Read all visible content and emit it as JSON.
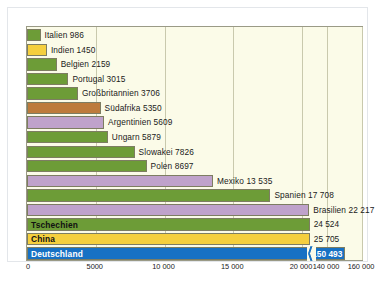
{
  "chart_data": {
    "type": "bar",
    "orientation": "horizontal",
    "title": "",
    "xlabel": "",
    "ylabel": "",
    "grid": true,
    "legend": "none",
    "axis_break": true,
    "xticks": [
      "0",
      "5000",
      "10 000",
      "15 000",
      "20 000",
      "140 000",
      "160 000"
    ],
    "xtick_values": [
      0,
      5000,
      10000,
      15000,
      20000,
      140000,
      160000
    ],
    "xlim": [
      0,
      160000
    ],
    "categories": [
      "Italien",
      "Indien",
      "Belgien",
      "Portugal",
      "Großbritannien",
      "Südafrika",
      "Argentinien",
      "Ungarn",
      "Slowakei",
      "Polen",
      "Mexiko",
      "Spanien",
      "Brasilien",
      "Tschechien",
      "China",
      "Deutschland"
    ],
    "values": [
      986,
      1450,
      2159,
      3015,
      3706,
      5350,
      5609,
      5879,
      7826,
      8697,
      13535,
      17708,
      22217,
      24524,
      25705,
      150493
    ],
    "value_labels": [
      "986",
      "1450",
      "2159",
      "3015",
      "3706",
      "5350",
      "5609",
      "5879",
      "7826",
      "8697",
      "13 535",
      "17 708",
      "22 217",
      "24 524",
      "25 705",
      "150 493"
    ],
    "rows": [
      {
        "name": "Italien",
        "value": 986,
        "value_label": "986",
        "label": "Italien 986",
        "color": "green",
        "label_position": "outside"
      },
      {
        "name": "Indien",
        "value": 1450,
        "value_label": "1450",
        "label": "Indien  1450",
        "color": "yellow",
        "label_position": "outside"
      },
      {
        "name": "Belgien",
        "value": 2159,
        "value_label": "2159",
        "label": "Belgien  2159",
        "color": "green",
        "label_position": "outside"
      },
      {
        "name": "Portugal",
        "value": 3015,
        "value_label": "3015",
        "label": "Portugal  3015",
        "color": "green",
        "label_position": "outside"
      },
      {
        "name": "Großbritannien",
        "value": 3706,
        "value_label": "3706",
        "label": "Großbritannien  3706",
        "color": "green",
        "label_position": "outside"
      },
      {
        "name": "Südafrika",
        "value": 5350,
        "value_label": "5350",
        "label": "Südafrika 5350",
        "color": "brown",
        "label_position": "outside"
      },
      {
        "name": "Argentinien",
        "value": 5609,
        "value_label": "5609",
        "label": "Argentinien 5609",
        "color": "purple",
        "label_position": "outside"
      },
      {
        "name": "Ungarn",
        "value": 5879,
        "value_label": "5879",
        "label": "Ungarn  5879",
        "color": "green",
        "label_position": "outside"
      },
      {
        "name": "Slowakei",
        "value": 7826,
        "value_label": "7826",
        "label": "Slowakei  7826",
        "color": "green",
        "label_position": "outside"
      },
      {
        "name": "Polen",
        "value": 8697,
        "value_label": "8697",
        "label": "Polen  8697",
        "color": "green",
        "label_position": "outside"
      },
      {
        "name": "Mexiko",
        "value": 13535,
        "value_label": "13 535",
        "label": "Mexiko  13 535",
        "color": "purple",
        "label_position": "outside"
      },
      {
        "name": "Spanien",
        "value": 17708,
        "value_label": "17 708",
        "label": "Spanien  17 708",
        "color": "green",
        "label_position": "outside"
      },
      {
        "name": "Brasilien",
        "value": 22217,
        "value_label": "22 217",
        "label": "Brasilien  22 217",
        "color": "purple",
        "label_position": "outside"
      },
      {
        "name": "Tschechien",
        "value": 24524,
        "value_label": "24 524",
        "label": "Tschechien",
        "color": "green",
        "label_position": "inside",
        "label_text_color": "dark"
      },
      {
        "name": "China",
        "value": 25705,
        "value_label": "25 705",
        "label": "China",
        "color": "yellow",
        "label_position": "inside",
        "label_text_color": "dark"
      },
      {
        "name": "Deutschland",
        "value": 150493,
        "value_label": "150 493",
        "label": "Deutschland",
        "color": "blue",
        "label_position": "inside",
        "label_text_color": "light",
        "value_inside": true
      }
    ]
  },
  "colors": {
    "green": "#6d9c37",
    "yellow": "#f5cf3e",
    "purple": "#bfa2cb",
    "brown": "#bd7b3c",
    "blue": "#1771c4",
    "plot_background": "#fbfbe8",
    "gridline": "#c9c9ad",
    "plot_border": "#9a9a86",
    "page_background": "#ffffff"
  },
  "caption": {
    "text": ""
  }
}
